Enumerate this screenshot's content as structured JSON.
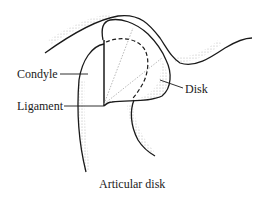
{
  "diagram": {
    "caption": "Articular disk",
    "labels": {
      "condyle": "Condyle",
      "ligament": "Ligament",
      "disk": "Disk"
    },
    "colors": {
      "line": "#1a1a1a",
      "stipple": "#b0b0b0",
      "background": "#ffffff"
    }
  }
}
